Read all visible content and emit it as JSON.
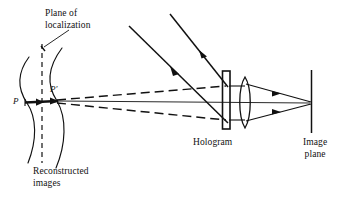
{
  "figure": {
    "type": "optics-ray-diagram",
    "background_color": "#ffffff",
    "ink_color": "#111111"
  },
  "labels": {
    "plane_of_localization": "Plane of\nlocalization",
    "reconstructed_images": "Reconstructed\nimages",
    "hologram": "Hologram",
    "image_plane": "Image\nplane",
    "point_p": "P",
    "point_p_prime": "P′"
  },
  "elements": {
    "wavefront_curves": {
      "name": "reconstructed-image-caustic-curves",
      "count": 2,
      "style": "solid"
    },
    "localization_plane_line": {
      "name": "plane-of-localization-line",
      "style": "dashed",
      "orientation": "vertical"
    },
    "diverging_rays": {
      "count": 3,
      "styles": [
        "dashed",
        "solid",
        "dashed"
      ],
      "origin": "P′"
    },
    "illumination_rays": {
      "count": 2,
      "style": "solid",
      "direction": "down-right",
      "arrowheads": true
    },
    "hologram_plate": {
      "name": "hologram-plate",
      "shape": "vertical-rectangle"
    },
    "lens": {
      "name": "converging-lens",
      "shape": "biconvex"
    },
    "image_plane_line": {
      "name": "image-plane-line",
      "orientation": "vertical"
    },
    "converging_rays": {
      "count": 2,
      "style": "solid",
      "arrowheads": true
    },
    "leader_line": {
      "name": "plane-of-localization-leader",
      "style": "solid"
    }
  },
  "colors": {
    "ink": "#111111",
    "paper": "#ffffff"
  }
}
